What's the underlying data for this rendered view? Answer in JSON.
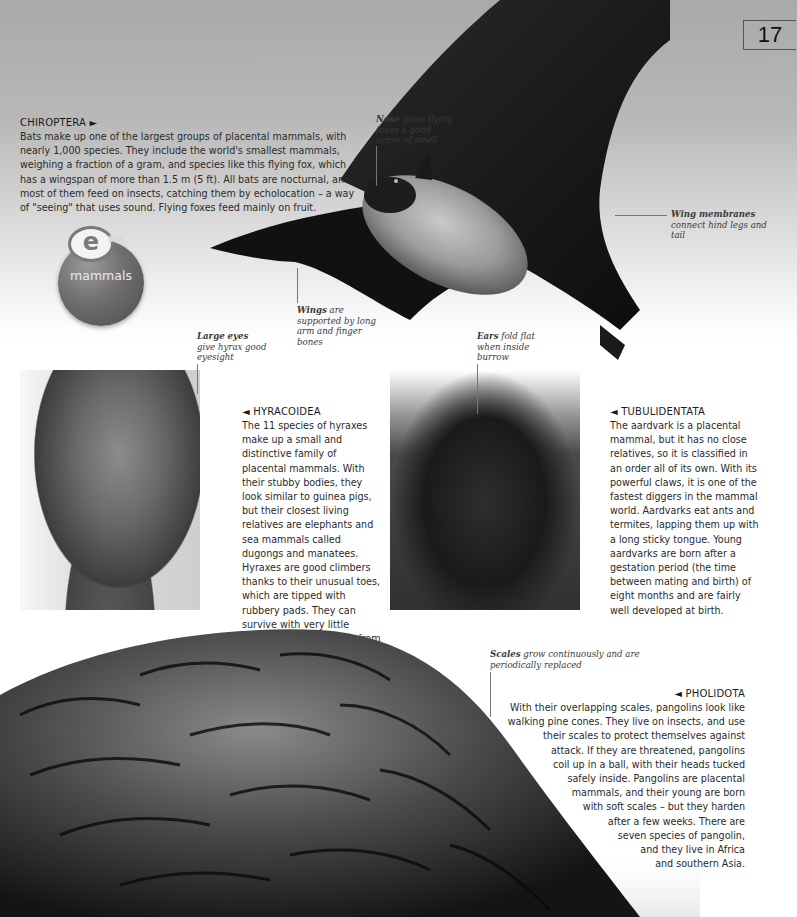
{
  "page": {
    "number": "17"
  },
  "colors": {
    "sky_top": "#a9a9a9",
    "page_bg": "#ffffff",
    "text": "#2a2a2a",
    "badge": "#6e6e6e"
  },
  "chiroptera": {
    "title": "CHIROPTERA ►",
    "body": "Bats make up one of the largest groups of placental mammals, with nearly 1,000 species. They include the world's smallest mammals, weighing a fraction of a gram, and species like this flying fox, which has a wingspan of more than 1.5 m (5 ft). All bats are nocturnal, and most of them feed on insects, catching them by echolocation – a way of \"seeing\" that uses sound. Flying foxes feed mainly on fruit.",
    "captions": {
      "nose_bold": "Nose",
      "nose_text": " gives flying foxes a good sense of smell",
      "wing_membranes_bold": "Wing membranes",
      "wing_membranes_text": " connect hind legs and tail",
      "wings_bold": "Wings",
      "wings_text": " are supported by long arm and finger bones"
    }
  },
  "badge": {
    "icon": "e-link-icon",
    "letter": "e",
    "arrows": "▶▶|",
    "label": "mammals"
  },
  "hyracoidea": {
    "title": "◄ HYRACOIDEA",
    "body": "The 11 species of hyraxes make up a small and distinctive family of placental mammals. With their stubby bodies, they look similar to guinea pigs, but their closest living relatives are elephants and sea mammals called dugongs and manatees. Hyraxes are good climbers thanks to their unusual toes, which are tipped with rubbery pads. They can survive with very little water, getting moisture from their food.",
    "caption_bold": "Large eyes",
    "caption_text": " give hyrax good eyesight"
  },
  "tubulidentata": {
    "title": "◄ TUBULIDENTATA",
    "body": "The aardvark is a placental mammal, but it has no close relatives, so it is classified in an order all of its own. With its powerful claws, it is one of the fastest diggers in the mammal world. Aardvarks eat ants and termites, lapping them up with a long sticky tongue. Young aardvarks are born after a gestation period (the time between mating and birth) of eight months and are fairly well developed at birth.",
    "caption_bold": "Ears",
    "caption_text": " fold flat when inside burrow"
  },
  "pholidota": {
    "title": "◄ PHOLIDOTA",
    "lines": [
      "With their overlapping scales, pangolins look like",
      "walking pine cones. They live on insects, and use",
      "their scales to protect themselves against",
      "attack. If they are threatened, pangolins",
      "coil up in a ball, with their heads tucked",
      "safely inside. Pangolins are placental",
      "mammals, and their young are born",
      "with soft scales – but they harden",
      "after a few weeks. There are",
      "seven species of pangolin,",
      "and they live in Africa",
      "and southern Asia."
    ],
    "caption_bold": "Scales",
    "caption_text": " grow continuously and are periodically replaced"
  }
}
